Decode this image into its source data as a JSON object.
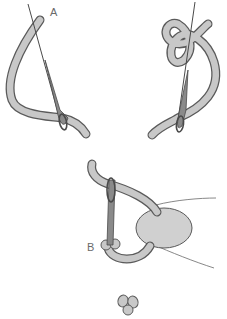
{
  "diagram": {
    "labels": {
      "a": "A",
      "b": "B"
    },
    "steps": [
      {
        "id": "step-1",
        "description": "Needle inserted at A beside thread"
      },
      {
        "id": "step-2",
        "description": "Thread wrapped around needle"
      },
      {
        "id": "step-3",
        "description": "Needle inserted at B, thread held"
      },
      {
        "id": "step-4",
        "description": "Finished knot"
      }
    ],
    "colors": {
      "thread_fill": "#c8c8c8",
      "thread_outline": "#5a5a5a",
      "needle": "#7a7a7a",
      "finger": "#d0d0d0",
      "label": "#6a6a6a"
    }
  }
}
